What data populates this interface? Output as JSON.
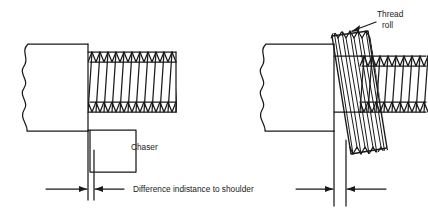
{
  "figure": {
    "background_color": "#ffffff",
    "line_color": "#1a1a1a"
  },
  "labels": {
    "chaser": "Chaser",
    "thread_roll_line1": "Thread",
    "thread_roll_line2": "roll",
    "dimension_note": "Difference indistance to shoulder"
  },
  "panels": [
    {
      "name": "left-panel-chaser",
      "description": "Workpiece with external thread cut by a chaser tool",
      "workpiece": {
        "x": 22,
        "y": 44,
        "width": 66,
        "height": 88,
        "break_edge": "left-wavy"
      },
      "thread": {
        "x": 88,
        "y": 52,
        "width": 88,
        "height": 60,
        "teeth": 12,
        "orientation": "horizontal"
      },
      "tool": {
        "name": "chaser",
        "x": 88,
        "y": 130,
        "width": 48,
        "height": 42
      }
    },
    {
      "name": "right-panel-thread-roll",
      "description": "Workpiece with external thread formed by a tilted thread roll",
      "workpiece": {
        "x": 258,
        "y": 44,
        "width": 76,
        "height": 88,
        "break_edge": "left-wavy"
      },
      "thread": {
        "x": 360,
        "y": 56,
        "width": 66,
        "height": 56,
        "teeth": 9,
        "orientation": "horizontal"
      },
      "tool": {
        "name": "thread-roll",
        "tilt_degrees": 14,
        "teeth": 10
      }
    }
  ],
  "dimensions": [
    {
      "name": "left-gap-dimension",
      "arrow_y": 189,
      "line_a_x": 88,
      "line_b_x": 94
    },
    {
      "name": "right-gap-dimension",
      "arrow_y": 189,
      "line_a_x": 334,
      "line_b_x": 346
    }
  ],
  "icons": {
    "arrow_right": "arrow-right-icon",
    "arrow_left": "arrow-left-icon",
    "leader_arrow": "leader-arrow-icon"
  }
}
